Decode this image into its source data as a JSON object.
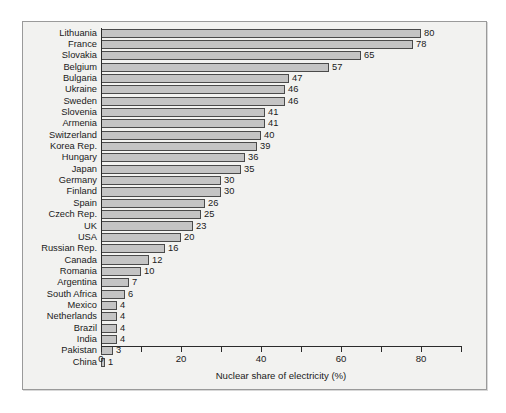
{
  "chart_data": {
    "type": "bar",
    "orientation": "horizontal",
    "title": "",
    "xlabel": "Nuclear share of electricity (%)",
    "ylabel": "",
    "xlim": [
      0,
      90
    ],
    "grid": false,
    "legend": null,
    "xticks_major": [
      0,
      20,
      40,
      60,
      80
    ],
    "xticks_minor": [
      10,
      30,
      50,
      70,
      90
    ],
    "xtick_labels": [
      "0",
      "20",
      "40",
      "60",
      "80"
    ],
    "bar_color": "#c4c4c4",
    "bar_edge_color": "#4a4a4a",
    "categories": [
      "Lithuania",
      "France",
      "Slovakia",
      "Belgium",
      "Bulgaria",
      "Ukraine",
      "Sweden",
      "Slovenia",
      "Armenia",
      "Switzerland",
      "Korea Rep.",
      "Hungary",
      "Japan",
      "Germany",
      "Finland",
      "Spain",
      "Czech Rep.",
      "UK",
      "USA",
      "Russian Rep.",
      "Canada",
      "Romania",
      "Argentina",
      "South Africa",
      "Mexico",
      "Netherlands",
      "Brazil",
      "India",
      "Pakistan",
      "China"
    ],
    "values": [
      80,
      78,
      65,
      57,
      47,
      46,
      46,
      41,
      41,
      40,
      39,
      36,
      35,
      30,
      30,
      26,
      25,
      23,
      20,
      16,
      12,
      10,
      7,
      6,
      4,
      4,
      4,
      4,
      3,
      1
    ],
    "data_labels": [
      "80",
      "78",
      "65",
      "57",
      "47",
      "46",
      "46",
      "41",
      "41",
      "40",
      "39",
      "36",
      "35",
      "30",
      "30",
      "26",
      "25",
      "23",
      "20",
      "16",
      "12",
      "10",
      "7",
      "6",
      "4",
      "4",
      "4",
      "4",
      "3",
      "1"
    ]
  }
}
